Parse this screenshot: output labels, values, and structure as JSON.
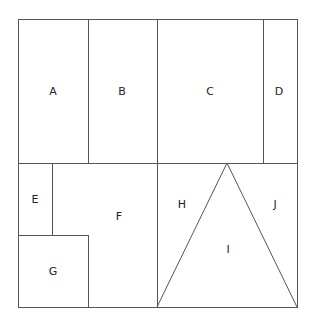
{
  "diagram": {
    "type": "partitioned-square",
    "colors": {
      "line": "#555555",
      "text": "#222222",
      "background": "#ffffff"
    },
    "regions": [
      {
        "id": "A",
        "label": "A",
        "shape": "rectangle"
      },
      {
        "id": "B",
        "label": "B",
        "shape": "rectangle"
      },
      {
        "id": "C",
        "label": "C",
        "shape": "rectangle"
      },
      {
        "id": "D",
        "label": "D",
        "shape": "rectangle"
      },
      {
        "id": "E",
        "label": "E",
        "shape": "rectangle"
      },
      {
        "id": "F",
        "label": "F",
        "shape": "L-shape"
      },
      {
        "id": "G",
        "label": "G",
        "shape": "square"
      },
      {
        "id": "H",
        "label": "H",
        "shape": "right-triangle"
      },
      {
        "id": "I",
        "label": "I",
        "shape": "triangle"
      },
      {
        "id": "J",
        "label": "J",
        "shape": "right-triangle"
      }
    ]
  }
}
